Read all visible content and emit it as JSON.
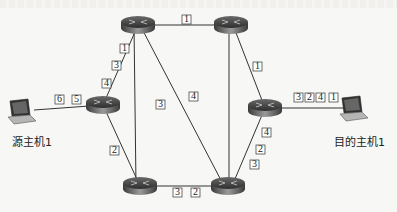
{
  "diagram": {
    "type": "network-routing",
    "hosts": [
      {
        "id": "src",
        "label": "源主机1",
        "x": 20,
        "y": 110
      },
      {
        "id": "dst",
        "label": "目的主机1",
        "x": 357,
        "y": 108
      }
    ],
    "routers": [
      {
        "id": "r_tl",
        "x": 138,
        "y": 25
      },
      {
        "id": "r_tr",
        "x": 231,
        "y": 25
      },
      {
        "id": "r_l",
        "x": 103,
        "y": 105
      },
      {
        "id": "r_r",
        "x": 265,
        "y": 108
      },
      {
        "id": "r_bl",
        "x": 140,
        "y": 186
      },
      {
        "id": "r_br",
        "x": 228,
        "y": 186
      }
    ],
    "links": [
      {
        "from": "r_tl",
        "to": "r_tr",
        "packets": [
          "1"
        ]
      },
      {
        "from": "r_tl",
        "to": "r_l",
        "packets": [
          "1",
          "3",
          "4"
        ]
      },
      {
        "from": "r_tl",
        "to": "r_bl",
        "packets": [
          "3"
        ]
      },
      {
        "from": "r_tl",
        "to": "r_br",
        "packets": [
          "4"
        ]
      },
      {
        "from": "r_tr",
        "to": "r_br",
        "packets": []
      },
      {
        "from": "r_tr",
        "to": "r_r",
        "packets": [
          "1"
        ]
      },
      {
        "from": "r_l",
        "to": "r_bl",
        "packets": [
          "2"
        ]
      },
      {
        "from": "r_bl",
        "to": "r_br",
        "packets": [
          "3",
          "2"
        ]
      },
      {
        "from": "r_r",
        "to": "r_br",
        "packets": [
          "4",
          "2",
          "3"
        ]
      },
      {
        "from": "src",
        "to": "r_l",
        "packets": [
          "6",
          "5"
        ]
      },
      {
        "from": "r_r",
        "to": "dst",
        "packets": [
          "3",
          "2",
          "4",
          "1"
        ]
      }
    ],
    "labels": {
      "src_host": "源主机1",
      "dst_host": "目的主机1",
      "p_tl_tr": "1",
      "p_tl_l_1": "1",
      "p_tl_l_3": "3",
      "p_tl_l_4": "4",
      "p_tl_bl": "3",
      "p_tl_br": "4",
      "p_tr_r": "1",
      "p_l_bl": "2",
      "p_bl_br_3": "3",
      "p_bl_br_2": "2",
      "p_r_br_4": "4",
      "p_r_br_2": "2",
      "p_r_br_3": "3",
      "p_src_6": "6",
      "p_src_5": "5",
      "p_dst_3": "3",
      "p_dst_2": "2",
      "p_dst_4": "4",
      "p_dst_1": "1"
    }
  }
}
